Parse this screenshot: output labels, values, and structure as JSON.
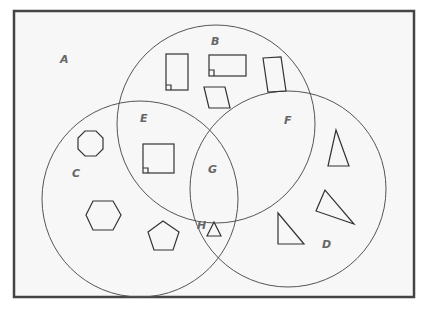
{
  "diagram": {
    "type": "venn",
    "colors": {
      "frame": "#444444",
      "circle": "#555555",
      "shape": "#333333",
      "label": "#666666",
      "background": "#f7f7f7"
    },
    "regions": [
      {
        "id": "A",
        "label": "A",
        "x": 62,
        "y": 63
      },
      {
        "id": "B",
        "label": "B",
        "x": 213,
        "y": 44
      },
      {
        "id": "C",
        "label": "C",
        "x": 73,
        "y": 176
      },
      {
        "id": "D",
        "label": "D",
        "x": 323,
        "y": 247
      },
      {
        "id": "E",
        "label": "E",
        "x": 141,
        "y": 121
      },
      {
        "id": "F",
        "label": "F",
        "x": 285,
        "y": 123
      },
      {
        "id": "G",
        "label": "G",
        "x": 209,
        "y": 172
      },
      {
        "id": "H",
        "label": "H",
        "x": 198,
        "y": 228
      }
    ],
    "sets": [
      {
        "name": "B",
        "shape": "quadrilaterals (top circle)"
      },
      {
        "name": "C",
        "shape": "polygons with 5+ sides / squares (left circle)"
      },
      {
        "name": "D",
        "shape": "triangles (right circle)"
      }
    ],
    "shapes_in_regions": {
      "B": [
        "rectangle with right angle",
        "rectangle with right angle",
        "parallelogram",
        "trapezoid"
      ],
      "C": [
        "octagon",
        "hexagon",
        "pentagon"
      ],
      "D": [
        "triangle",
        "triangle",
        "triangle"
      ],
      "E": [
        "square with right angle"
      ],
      "F": [
        "triangle"
      ],
      "G": [],
      "H": [
        "small triangle"
      ],
      "A": []
    }
  }
}
